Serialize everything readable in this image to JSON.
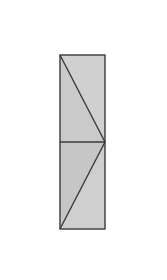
{
  "diagram": {
    "type": "geometric-figure",
    "colors": {
      "background": "#ffffff",
      "fill_light": "#cfcfcf",
      "fill_dark": "#c4c4c4",
      "stroke": "#3a3a3a"
    },
    "rectangle": {
      "x": 60,
      "y": 55,
      "width": 45,
      "height": 174
    },
    "midline_y": 142,
    "diagonals": [
      {
        "from": [
          60,
          55
        ],
        "to": [
          105,
          142
        ]
      },
      {
        "from": [
          105,
          142
        ],
        "to": [
          60,
          229
        ]
      }
    ]
  }
}
